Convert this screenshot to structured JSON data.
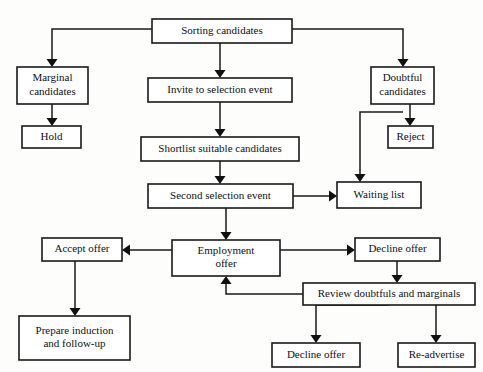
{
  "diagram": {
    "page_width": 483,
    "page_height": 372,
    "background_color": "#fdfdfc",
    "line_color": "#1a1a1a",
    "box_fill": "#ffffff",
    "top_cropped_text": "",
    "nodes": [
      {
        "id": "sorting",
        "label": "Sorting candidates",
        "lines": [
          "Sorting candidates"
        ],
        "x": 152,
        "y": 19,
        "w": 140,
        "h": 24
      },
      {
        "id": "marginal",
        "label": "Marginal candidates",
        "lines": [
          "Marginal",
          "candidates"
        ],
        "x": 17,
        "y": 67,
        "w": 71,
        "h": 37
      },
      {
        "id": "invite",
        "label": "Invite to selection event",
        "lines": [
          "Invite to selection event"
        ],
        "x": 148,
        "y": 78,
        "w": 144,
        "h": 24
      },
      {
        "id": "doubtful",
        "label": "Doubtful candidates",
        "lines": [
          "Doubtful",
          "candidates"
        ],
        "x": 371,
        "y": 67,
        "w": 63,
        "h": 37
      },
      {
        "id": "hold",
        "label": "Hold",
        "lines": [
          "Hold"
        ],
        "x": 22,
        "y": 126,
        "w": 59,
        "h": 22
      },
      {
        "id": "shortlist",
        "label": "Shortlist suitable candidates",
        "lines": [
          "Shortlist suitable candidates"
        ],
        "x": 141,
        "y": 137,
        "w": 158,
        "h": 24
      },
      {
        "id": "reject",
        "label": "Reject",
        "lines": [
          "Reject"
        ],
        "x": 388,
        "y": 126,
        "w": 45,
        "h": 22
      },
      {
        "id": "second",
        "label": "Second selection event",
        "lines": [
          "Second selection event"
        ],
        "x": 148,
        "y": 184,
        "w": 145,
        "h": 24
      },
      {
        "id": "waiting",
        "label": "Waiting list",
        "lines": [
          "Waiting list"
        ],
        "x": 337,
        "y": 182,
        "w": 84,
        "h": 26
      },
      {
        "id": "accept",
        "label": "Accept offer",
        "lines": [
          "Accept offer"
        ],
        "x": 42,
        "y": 238,
        "w": 80,
        "h": 23
      },
      {
        "id": "employ",
        "label": "Employment offer",
        "lines": [
          "Employment",
          "offer"
        ],
        "x": 172,
        "y": 240,
        "w": 108,
        "h": 36
      },
      {
        "id": "decline1",
        "label": "Decline offer",
        "lines": [
          "Decline offer"
        ],
        "x": 355,
        "y": 238,
        "w": 85,
        "h": 23
      },
      {
        "id": "review",
        "label": "Review doubtfuls and marginals",
        "lines": [
          "Review doubtfuls and marginals"
        ],
        "x": 303,
        "y": 283,
        "w": 172,
        "h": 22
      },
      {
        "id": "prepare",
        "label": "Prepare induction and follow-up",
        "lines": [
          "Prepare induction",
          "and follow-up"
        ],
        "x": 19,
        "y": 316,
        "w": 111,
        "h": 44
      },
      {
        "id": "decline2",
        "label": "Decline offer",
        "lines": [
          "Decline offer"
        ],
        "x": 272,
        "y": 343,
        "w": 88,
        "h": 24
      },
      {
        "id": "readvert",
        "label": "Re-advertise",
        "lines": [
          "Re-advertise"
        ],
        "x": 398,
        "y": 343,
        "w": 77,
        "h": 24
      }
    ],
    "edges": [
      {
        "id": "e-sorting-marginal",
        "from": "sorting",
        "to": "marginal",
        "path": "M152,29 L52,29 L52,60",
        "arrow": "down",
        "ax": 52,
        "ay": 67
      },
      {
        "id": "e-sorting-invite",
        "from": "sorting",
        "to": "invite",
        "path": "M220,43 L220,71",
        "arrow": "down",
        "ax": 220,
        "ay": 78
      },
      {
        "id": "e-sorting-doubtful",
        "from": "sorting",
        "to": "doubtful",
        "path": "M292,29 L403,29 L403,60",
        "arrow": "down",
        "ax": 403,
        "ay": 67
      },
      {
        "id": "e-marginal-hold",
        "from": "marginal",
        "to": "hold",
        "path": "M52,104 L52,119",
        "arrow": "down",
        "ax": 52,
        "ay": 126
      },
      {
        "id": "e-invite-shortlist",
        "from": "invite",
        "to": "shortlist",
        "path": "M220,102 L220,130",
        "arrow": "down",
        "ax": 220,
        "ay": 137
      },
      {
        "id": "e-doubtful-reject",
        "from": "doubtful",
        "to": "reject",
        "path": "M410,104 L410,119",
        "arrow": "down",
        "ax": 410,
        "ay": 126
      },
      {
        "id": "e-doubtful-waiting",
        "from": "doubtful",
        "to": "waiting",
        "path": "M403,112 L360,112 L360,175",
        "arrow": "down",
        "ax": 360,
        "ay": 182
      },
      {
        "id": "e-shortlist-second",
        "from": "shortlist",
        "to": "second",
        "path": "M220,161 L220,177",
        "arrow": "down",
        "ax": 220,
        "ay": 184
      },
      {
        "id": "e-second-waiting",
        "from": "second",
        "to": "waiting",
        "path": "M293,196 L330,196",
        "arrow": "right",
        "ax": 337,
        "ay": 196
      },
      {
        "id": "e-second-employ",
        "from": "second",
        "to": "employ",
        "path": "M226,208 L226,233",
        "arrow": "down",
        "ax": 226,
        "ay": 240
      },
      {
        "id": "e-employ-accept",
        "from": "employ",
        "to": "accept",
        "path": "M172,250 L129,250",
        "arrow": "left",
        "ax": 122,
        "ay": 250
      },
      {
        "id": "e-employ-decline1",
        "from": "employ",
        "to": "decline1",
        "path": "M280,250 L348,250",
        "arrow": "right",
        "ax": 355,
        "ay": 250
      },
      {
        "id": "e-accept-prepare",
        "from": "accept",
        "to": "prepare",
        "path": "M75,261 L75,309",
        "arrow": "down",
        "ax": 75,
        "ay": 316
      },
      {
        "id": "e-decline1-review",
        "from": "decline1",
        "to": "review",
        "path": "M397,261 L397,276",
        "arrow": "down",
        "ax": 397,
        "ay": 283
      },
      {
        "id": "e-review-employ",
        "from": "review",
        "to": "employ",
        "path": "M303,294 L226,294 L226,283",
        "arrow": "up",
        "ax": 226,
        "ay": 276
      },
      {
        "id": "e-review-decline2",
        "from": "review",
        "to": "decline2",
        "path": "M389,305 L316,305 L316,336",
        "arrow": "down",
        "ax": 316,
        "ay": 343
      },
      {
        "id": "e-review-readvert",
        "from": "review",
        "to": "readvert",
        "path": "M436,305 L436,336",
        "arrow": "down",
        "ax": 436,
        "ay": 343
      }
    ]
  }
}
